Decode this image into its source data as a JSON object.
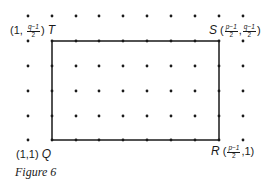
{
  "figure": {
    "caption": "Figure 6",
    "grid": {
      "columns": 10,
      "rows": 6,
      "x_positions": [
        28,
        52,
        76,
        99,
        123,
        147,
        171,
        195,
        219,
        243
      ],
      "y_positions": [
        16,
        41,
        66,
        91,
        116,
        140
      ],
      "dot_color": "#1a1a1a"
    },
    "rectangle": {
      "x1": 52,
      "y1": 41,
      "x2": 219,
      "y2": 140,
      "stroke": "#1a1a1a"
    },
    "points": {
      "T": {
        "name": "T",
        "coord_prefix": "(1,",
        "coord_frac_num": "q−1",
        "coord_frac_den": "2",
        "coord_suffix": ")"
      },
      "S": {
        "name": "S",
        "coord_prefix": "(",
        "frac1_num": "p−1",
        "frac1_den": "2",
        "sep": ",",
        "frac2_num": "q−1",
        "frac2_den": "2",
        "coord_suffix": ")"
      },
      "Q": {
        "name": "Q",
        "coord": "(1,1)"
      },
      "R": {
        "name": "R",
        "coord_prefix": "(",
        "coord_frac_num": "p−1",
        "coord_frac_den": "2",
        "coord_suffix": ",1)"
      }
    }
  }
}
